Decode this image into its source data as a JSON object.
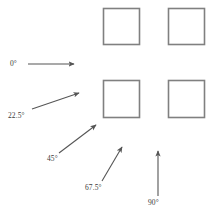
{
  "figure": {
    "type": "angle-orientation-diagram",
    "background_color": "#ffffff",
    "squares": {
      "count": 4,
      "stroke_color": "#808080",
      "fill_color": "#ffffff",
      "layout": "2x2-grid",
      "items": [
        {
          "name": "square-top-left",
          "x": 103,
          "y": 8,
          "w": 37,
          "h": 37
        },
        {
          "name": "square-top-right",
          "x": 168,
          "y": 8,
          "w": 37,
          "h": 37
        },
        {
          "name": "square-bottom-left",
          "x": 103,
          "y": 80,
          "w": 37,
          "h": 38
        },
        {
          "name": "square-bottom-right",
          "x": 168,
          "y": 80,
          "w": 37,
          "h": 38
        }
      ]
    },
    "arrows": {
      "stroke_color": "#555555",
      "items": [
        {
          "name": "arrow-0",
          "label": "0°",
          "angle_degrees": 0,
          "x1": 28,
          "y1": 64,
          "x2": 76,
          "y2": 64,
          "label_x": 10,
          "label_y": 60
        },
        {
          "name": "arrow-22-5",
          "label": "22.5°",
          "angle_degrees": 22.5,
          "x1": 32,
          "y1": 109,
          "x2": 81,
          "y2": 92,
          "label_x": 8,
          "label_y": 112
        },
        {
          "name": "arrow-45",
          "label": "45°",
          "angle_degrees": 45,
          "x1": 59,
          "y1": 153,
          "x2": 98,
          "y2": 123,
          "label_x": 47,
          "label_y": 155
        },
        {
          "name": "arrow-67-5",
          "label": "67.5°",
          "angle_degrees": 67.5,
          "x1": 102,
          "y1": 181,
          "x2": 123,
          "y2": 145,
          "label_x": 85,
          "label_y": 184
        },
        {
          "name": "arrow-90",
          "label": "90°",
          "angle_degrees": 90,
          "x1": 158,
          "y1": 196,
          "x2": 158,
          "y2": 149,
          "label_x": 148,
          "label_y": 199
        }
      ]
    }
  }
}
